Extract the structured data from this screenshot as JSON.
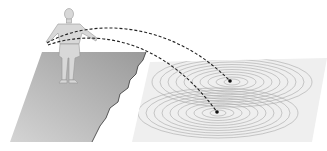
{
  "figure": {
    "colors": {
      "background": "#ffffff",
      "ground": "#b8b8b8",
      "water": "#ececec",
      "ripple": "#a8a8a8",
      "person": "#d6d6d6",
      "trajectory": "#222222"
    },
    "impacts": [
      {
        "label": "impact-upper",
        "x": 230,
        "y": 81
      },
      {
        "label": "impact-lower",
        "x": 217,
        "y": 112
      }
    ]
  }
}
